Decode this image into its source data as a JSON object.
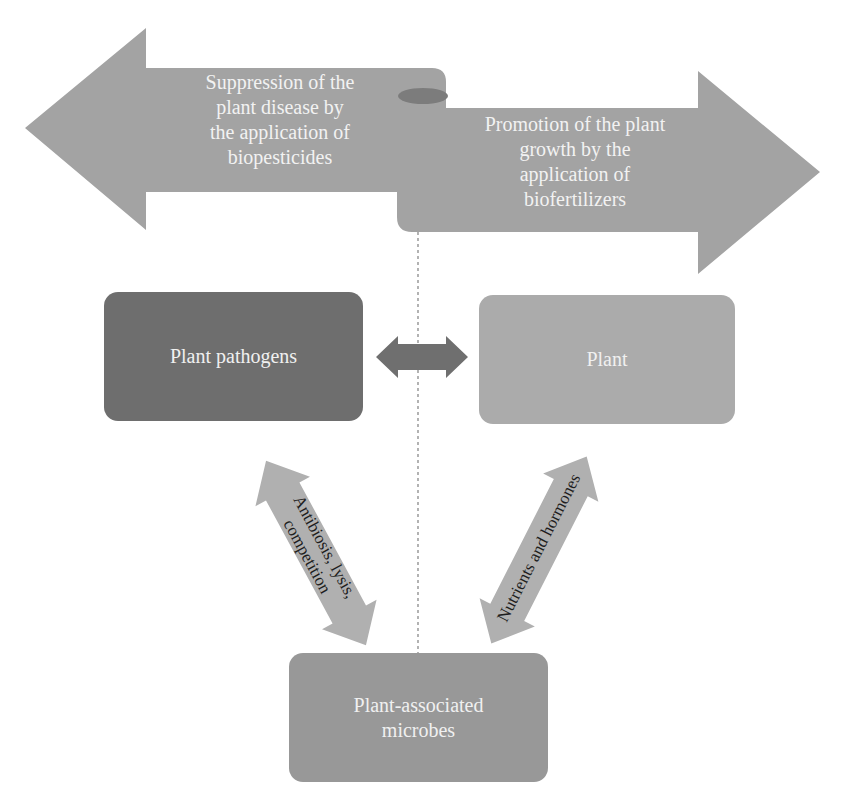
{
  "figure": {
    "top_arrows": {
      "left": {
        "text": "Suppression of the\nplant disease by\nthe application of\nbiopesticides",
        "direction": "left"
      },
      "right": {
        "text": "Promotion of the plant\ngrowth by the\napplication of\nbiofertilizers",
        "direction": "right"
      }
    },
    "boxes": {
      "pathogens": {
        "label": "Plant pathogens"
      },
      "plant": {
        "label": "Plant"
      },
      "microbes": {
        "label": "Plant-associated\nmicrobes"
      }
    },
    "connectors": {
      "pathogens_plant": {
        "label": "",
        "type": "double-arrow"
      },
      "microbes_pathogens": {
        "label": "Antibiosis, lysis,\ncompetition",
        "type": "double-arrow"
      },
      "microbes_plant": {
        "label": "Nutrients and hormones",
        "type": "double-arrow"
      }
    },
    "divider": {
      "style": "dashed",
      "orientation": "vertical"
    }
  },
  "colors": {
    "ribbon": "#a3a3a3",
    "ribbon_fold": "#7c7c7c",
    "pathogens_box": "#6e6e6e",
    "plant_box": "#ababab",
    "microbes_box": "#989898",
    "middle_arrow": "#6f6f6f",
    "diag_arrow": "#b0b0b0",
    "divider": "#8a8a8a"
  }
}
